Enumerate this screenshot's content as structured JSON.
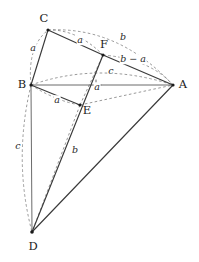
{
  "figure": {
    "canvas": {
      "width": 199,
      "height": 262,
      "background": "#ffffff"
    },
    "stroke_colors": {
      "solid": "#3a3a3a",
      "thin": "#5a5a5a",
      "dashed": "#777777",
      "vertex": "#1a1a1a",
      "text": "#1c1c1c"
    },
    "vertices": [
      {
        "id": "A",
        "label": "A",
        "x": 173,
        "y": 85,
        "label_x": 183,
        "label_y": 85
      },
      {
        "id": "B",
        "label": "B",
        "x": 31,
        "y": 85,
        "label_x": 22,
        "label_y": 85
      },
      {
        "id": "C",
        "label": "C",
        "x": 48,
        "y": 30,
        "label_x": 44,
        "label_y": 19
      },
      {
        "id": "D",
        "label": "D",
        "x": 32,
        "y": 232,
        "label_x": 33,
        "label_y": 247
      },
      {
        "id": "E",
        "label": "E",
        "x": 80,
        "y": 105,
        "label_x": 87,
        "label_y": 111
      },
      {
        "id": "F",
        "label": "F",
        "x": 103,
        "y": 55,
        "label_x": 104,
        "label_y": 45
      }
    ],
    "solid_edges": [
      {
        "name": "edge-B-C",
        "from": "B",
        "to": "C"
      },
      {
        "name": "edge-C-F",
        "from": "C",
        "to": "F"
      },
      {
        "name": "edge-F-A",
        "from": "F",
        "to": "A"
      },
      {
        "name": "edge-B-A",
        "from": "B",
        "to": "A"
      },
      {
        "name": "edge-B-E",
        "from": "B",
        "to": "E"
      },
      {
        "name": "edge-B-D",
        "from": "B",
        "to": "D"
      },
      {
        "name": "edge-D-A",
        "from": "D",
        "to": "A"
      },
      {
        "name": "edge-D-F",
        "from": "D",
        "to": "F"
      }
    ],
    "dashed_edges": [
      {
        "name": "dashed-E-D",
        "from": "E",
        "to": "D"
      },
      {
        "name": "dashed-E-F",
        "from": "E",
        "to": "F"
      },
      {
        "name": "dashed-C-B-low",
        "from": "C",
        "to": "B"
      }
    ],
    "dashed_arcs": [
      {
        "name": "arc-C-A",
        "d": "M 48 30 Q 118 26 173 85"
      },
      {
        "name": "arc-B-C",
        "d": "M 31 85 Q 28 47 48 30"
      },
      {
        "name": "arc-B-A",
        "d": "M 31 85 Q 100 62 173 85"
      },
      {
        "name": "arc-B-E",
        "d": "M 31 85 Q 56 100 80 105"
      },
      {
        "name": "arc-B-D",
        "d": "M 31 85 Q 14 160 32 232"
      },
      {
        "name": "arc-F-A-outer",
        "d": "M 103 55 Q 148 60 173 85"
      }
    ],
    "segment_labels": [
      {
        "name": "label-a-BC",
        "text": "a",
        "x": 33,
        "y": 48
      },
      {
        "name": "label-a-CF",
        "text": "a",
        "x": 80,
        "y": 40
      },
      {
        "name": "label-b-CA",
        "text": "b",
        "x": 123,
        "y": 37
      },
      {
        "name": "label-b-minus-a-FA",
        "text": "b − a",
        "x": 133,
        "y": 59
      },
      {
        "name": "label-c-BA",
        "text": "c",
        "x": 111,
        "y": 71
      },
      {
        "name": "label-a-FE",
        "text": "a",
        "x": 97,
        "y": 87
      },
      {
        "name": "label-a-BE",
        "text": "a",
        "x": 57,
        "y": 100
      },
      {
        "name": "label-c-BD",
        "text": "c",
        "x": 18,
        "y": 146
      },
      {
        "name": "label-b-ED",
        "text": "b",
        "x": 75,
        "y": 150
      }
    ],
    "right_angle_mark": {
      "name": "right-angle-mark-F",
      "x": 100,
      "y": 66,
      "size": 5
    }
  }
}
